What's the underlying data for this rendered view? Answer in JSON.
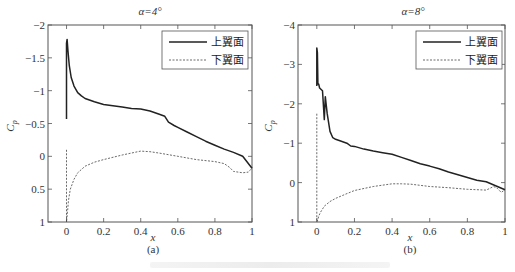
{
  "chart_data": [
    {
      "id": "a",
      "type": "line",
      "title": "α=4°",
      "caption": "(a)",
      "xlabel": "x",
      "ylabel": "C_p",
      "xlim": [
        -0.1,
        1
      ],
      "ylim": [
        -2,
        1
      ],
      "y_reversed": true,
      "xticks": [
        0,
        0.2,
        0.4,
        0.6,
        0.8,
        1
      ],
      "xtick_labels": [
        "0",
        "0.2",
        "0.4",
        "0.6",
        "0.8",
        "1"
      ],
      "yticks": [
        -2,
        -1.5,
        -1,
        -0.5,
        0,
        0.5,
        1
      ],
      "ytick_labels": [
        "−2",
        "−1.5",
        "−1",
        "−0.5",
        "0",
        "0.5",
        "1"
      ],
      "grid": false,
      "legend": {
        "placement": "top-right",
        "entries": [
          "上翼面",
          "下翼面"
        ]
      },
      "series": [
        {
          "name": "上翼面",
          "style": "solid",
          "x": [
            0,
            0,
            0.003,
            0.008,
            0.015,
            0.025,
            0.04,
            0.06,
            0.08,
            0.1,
            0.15,
            0.2,
            0.25,
            0.3,
            0.35,
            0.4,
            0.45,
            0.5,
            0.53,
            0.55,
            0.58,
            0.6,
            0.65,
            0.7,
            0.75,
            0.8,
            0.85,
            0.9,
            0.95,
            1.0
          ],
          "y": [
            -0.57,
            -1.72,
            -1.78,
            -1.6,
            -1.38,
            -1.2,
            -1.07,
            -0.97,
            -0.92,
            -0.88,
            -0.83,
            -0.79,
            -0.77,
            -0.75,
            -0.73,
            -0.72,
            -0.69,
            -0.64,
            -0.61,
            -0.52,
            -0.47,
            -0.44,
            -0.37,
            -0.3,
            -0.23,
            -0.17,
            -0.11,
            -0.06,
            0.0,
            0.18
          ]
        },
        {
          "name": "下翼面",
          "style": "dashed",
          "x": [
            0,
            0,
            0.005,
            0.01,
            0.02,
            0.04,
            0.06,
            0.1,
            0.15,
            0.2,
            0.3,
            0.4,
            0.45,
            0.5,
            0.6,
            0.7,
            0.8,
            0.85,
            0.88,
            0.9,
            0.95,
            0.98,
            1.0
          ],
          "y": [
            -0.1,
            1.0,
            0.85,
            0.68,
            0.5,
            0.35,
            0.25,
            0.15,
            0.09,
            0.05,
            -0.02,
            -0.08,
            -0.07,
            -0.05,
            0.0,
            0.05,
            0.08,
            0.11,
            0.17,
            0.23,
            0.25,
            0.24,
            0.18
          ]
        }
      ]
    },
    {
      "id": "b",
      "type": "line",
      "title": "α=8°",
      "caption": "(b)",
      "xlabel": "x",
      "ylabel": "C_p",
      "xlim": [
        -0.1,
        1
      ],
      "ylim": [
        -4,
        1
      ],
      "y_reversed": true,
      "xticks": [
        0,
        0.2,
        0.4,
        0.6,
        0.8,
        1
      ],
      "xtick_labels": [
        "0",
        "0.2",
        "0.4",
        "0.6",
        "0.8",
        "1"
      ],
      "yticks": [
        -4,
        -3,
        -2,
        -1,
        0,
        1
      ],
      "ytick_labels": [
        "−4",
        "−3",
        "−2",
        "−1",
        "0",
        "1"
      ],
      "grid": false,
      "legend": {
        "placement": "top-right",
        "entries": [
          "上翼面",
          "下翼面"
        ]
      },
      "series": [
        {
          "name": "上翼面",
          "style": "solid",
          "x": [
            0,
            0,
            0.003,
            0.006,
            0.01,
            0.015,
            0.03,
            0.04,
            0.045,
            0.055,
            0.07,
            0.085,
            0.1,
            0.13,
            0.16,
            0.18,
            0.2,
            0.25,
            0.3,
            0.35,
            0.4,
            0.45,
            0.5,
            0.55,
            0.6,
            0.65,
            0.7,
            0.75,
            0.8,
            0.85,
            0.9,
            0.95,
            1.0
          ],
          "y": [
            -2.45,
            -3.42,
            -3.3,
            -2.5,
            -2.5,
            -2.4,
            -2.33,
            -1.6,
            -2.18,
            -1.75,
            -1.3,
            -1.14,
            -1.1,
            -1.05,
            -1.0,
            -0.93,
            -0.92,
            -0.85,
            -0.8,
            -0.76,
            -0.72,
            -0.64,
            -0.56,
            -0.48,
            -0.42,
            -0.35,
            -0.27,
            -0.2,
            -0.13,
            -0.06,
            -0.02,
            0.08,
            0.18
          ]
        },
        {
          "name": "下翼面",
          "style": "dashed",
          "x": [
            0,
            0,
            0.005,
            0.01,
            0.02,
            0.04,
            0.07,
            0.1,
            0.15,
            0.2,
            0.3,
            0.4,
            0.45,
            0.5,
            0.6,
            0.7,
            0.8,
            0.9,
            0.94,
            0.96,
            0.98,
            1.0
          ],
          "y": [
            -1.75,
            1.0,
            0.95,
            0.85,
            0.75,
            0.6,
            0.48,
            0.4,
            0.3,
            0.2,
            0.1,
            0.03,
            0.03,
            0.04,
            0.1,
            0.13,
            0.17,
            0.19,
            0.1,
            0.15,
            0.25,
            0.18
          ]
        }
      ]
    }
  ]
}
